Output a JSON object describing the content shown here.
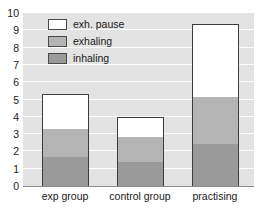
{
  "chart_data": {
    "type": "bar",
    "stacked": true,
    "title": "",
    "xlabel": "",
    "ylabel": "",
    "ylim": [
      0,
      10
    ],
    "yticks": [
      0,
      1,
      2,
      3,
      4,
      5,
      6,
      7,
      8,
      9,
      10
    ],
    "ytick_labels": [
      "0",
      "1",
      "2",
      "3",
      "4",
      "5",
      "6",
      "7",
      "8",
      "9",
      "10"
    ],
    "grid": true,
    "grid_axis": "y",
    "legend_position": "upper left inside",
    "categories": [
      "exp group",
      "control group",
      "practising"
    ],
    "series": [
      {
        "name": "inhaling",
        "values": [
          1.67,
          1.4,
          2.47
        ],
        "color": "#9a9a9a"
      },
      {
        "name": "exhaling",
        "values": [
          1.66,
          1.45,
          2.7
        ],
        "color": "#b4b4b4"
      },
      {
        "name": "exh. pause",
        "values": [
          1.97,
          1.15,
          4.2
        ],
        "color": "#ffffff"
      }
    ],
    "cumulative_tops": {
      "exp group": {
        "inhaling": 1.67,
        "exhaling": 3.33,
        "exh. pause": 5.3
      },
      "control group": {
        "inhaling": 1.4,
        "exhaling": 2.85,
        "exh. pause": 4.0
      },
      "practising": {
        "inhaling": 2.47,
        "exhaling": 5.17,
        "exh. pause": 9.37
      }
    },
    "totals": [
      5.3,
      4.0,
      9.37
    ],
    "plot_background": "#e3e3e3",
    "gridline_color": "#fdfdfd",
    "bar_outline_color": "#3d3d3d"
  },
  "legend": {
    "items": [
      {
        "label": "exh. pause",
        "color": "#ffffff"
      },
      {
        "label": "exhaling",
        "color": "#b4b4b4"
      },
      {
        "label": "inhaling",
        "color": "#9a9a9a"
      }
    ]
  },
  "y_axis": {
    "labels": [
      "10",
      "9",
      "8",
      "7",
      "6",
      "5",
      "4",
      "3",
      "2",
      "1",
      "0"
    ]
  },
  "x_axis": {
    "labels": [
      "exp group",
      "control group",
      "practising"
    ]
  }
}
